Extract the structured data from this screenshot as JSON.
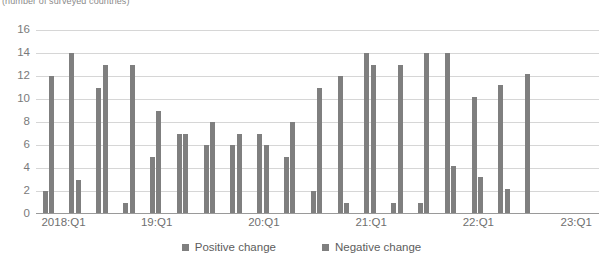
{
  "chart": {
    "subtitle": "(number of surveyed countries)",
    "legend": [
      {
        "label": "Positive change",
        "color": "#7f7f7f",
        "key": "positive"
      },
      {
        "label": "Negative change",
        "color": "#7f7f7f",
        "key": "negative"
      }
    ]
  },
  "chart_data": {
    "type": "bar",
    "title": "",
    "subtitle": "(number of surveyed countries)",
    "xlabel": "",
    "ylabel": "",
    "ylim": [
      0,
      16
    ],
    "yticks": [
      0,
      2,
      4,
      6,
      8,
      10,
      12,
      14,
      16
    ],
    "grid": true,
    "legend_position": "bottom",
    "categories": [
      "2018:Q1",
      "2018:Q2",
      "2018:Q3",
      "2018:Q4",
      "19:Q1",
      "19:Q2",
      "19:Q3",
      "19:Q4",
      "20:Q1",
      "20:Q2",
      "20:Q3",
      "20:Q4",
      "21:Q1",
      "21:Q2",
      "21:Q3",
      "21:Q4",
      "22:Q1",
      "22:Q2",
      "22:Q3",
      "22:Q4",
      "23:Q1"
    ],
    "tick_labels": [
      "2018:Q1",
      "19:Q1",
      "20:Q1",
      "21:Q1",
      "22:Q1",
      "23:Q1"
    ],
    "tick_label_indices": [
      0,
      4,
      8,
      12,
      16,
      20
    ],
    "series": [
      {
        "name": "Positive change",
        "color": "#7f7f7f",
        "values": [
          2,
          3,
          1,
          5,
          7,
          6,
          6,
          6,
          5,
          2,
          1,
          1,
          1,
          14,
          14,
          4.2,
          3.2,
          2.2,
          11,
          13,
          12.2
        ]
      },
      {
        "name": "Negative change",
        "color": "#7f7f7f",
        "values": [
          12,
          14,
          11,
          13,
          13,
          9,
          7,
          8,
          7,
          7,
          8,
          11,
          12,
          13,
          13,
          14,
          10.2,
          11.2,
          12,
          14,
          12.2
        ]
      }
    ],
    "bar_sequence": [
      {
        "q": "2018:Q1",
        "positive": 2,
        "negative": 12
      },
      {
        "q": "2018:Q2",
        "positive": 14,
        "negative": 3
      },
      {
        "q": "2018:Q3",
        "positive": 11,
        "negative": 13
      },
      {
        "q": "2018:Q4",
        "positive": 1,
        "negative": 13
      },
      {
        "q": "19:Q1",
        "positive": 5,
        "negative": 9
      },
      {
        "q": "19:Q2",
        "positive": 7,
        "negative": 7
      },
      {
        "q": "19:Q3",
        "positive": 6,
        "negative": 8
      },
      {
        "q": "19:Q4",
        "positive": 7,
        "negative": 6
      },
      {
        "q": "20:Q1",
        "positive": 7,
        "negative": 6
      },
      {
        "q": "20:Q2",
        "positive": 5,
        "negative": 8
      },
      {
        "q": "20:Q3",
        "positive": 2,
        "negative": 11
      },
      {
        "q": "20:Q4",
        "positive": 12,
        "negative": 1
      },
      {
        "q": "21:Q1",
        "positive": 14,
        "negative": 1
      },
      {
        "q": "21:Q2",
        "positive": 13,
        "negative": 1
      },
      {
        "q": "21:Q3",
        "positive": 13,
        "negative": 14
      },
      {
        "q": "21:Q4",
        "positive": 14,
        "negative": 4.2
      },
      {
        "q": "22:Q1",
        "positive": 10.2,
        "negative": 3.2
      },
      {
        "q": "22:Q2",
        "positive": 11.2,
        "negative": 2.2
      },
      {
        "q": "22:Q3",
        "positive": 12.2,
        "negative": 0
      }
    ],
    "bar_values_in_draw_order": [
      2,
      12,
      14,
      3,
      11,
      13,
      1,
      13,
      5,
      9,
      7,
      7,
      6,
      8,
      6,
      7,
      7,
      6,
      5,
      8,
      2,
      11,
      12,
      1,
      14,
      13,
      1,
      13,
      1,
      14,
      14,
      4.2,
      10.2,
      3.2,
      11.2,
      2.2,
      12.2
    ]
  }
}
